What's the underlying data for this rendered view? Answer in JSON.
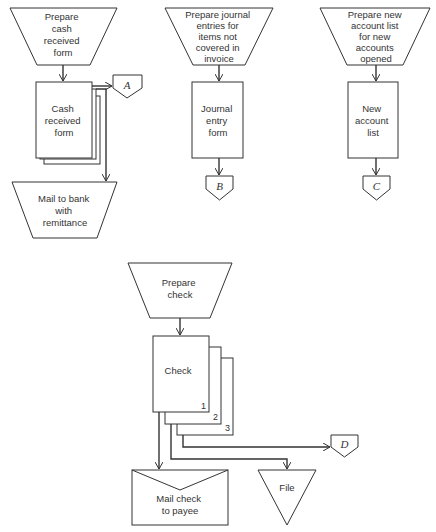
{
  "diagram": {
    "type": "flowchart",
    "flows": [
      {
        "id": "cash-received",
        "process": {
          "lines": [
            "Prepare",
            "cash",
            "received",
            "form"
          ]
        },
        "document": {
          "lines": [
            "Cash",
            "received",
            "form"
          ],
          "copies": 3
        },
        "connector": "A",
        "output": {
          "lines": [
            "Mail to bank",
            "with",
            "remittance"
          ]
        }
      },
      {
        "id": "journal-entry",
        "process": {
          "lines": [
            "Prepare journal",
            "entries for",
            "items not",
            "covered in",
            "invoice"
          ]
        },
        "document": {
          "lines": [
            "Journal",
            "entry",
            "form"
          ],
          "copies": 1
        },
        "connector": "B"
      },
      {
        "id": "new-account",
        "process": {
          "lines": [
            "Prepare new",
            "account list",
            "for new",
            "accounts",
            "opened"
          ]
        },
        "document": {
          "lines": [
            "New",
            "account",
            "list"
          ],
          "copies": 1
        },
        "connector": "C"
      },
      {
        "id": "check",
        "process": {
          "lines": [
            "Prepare",
            "check"
          ]
        },
        "document": {
          "lines": [
            "Check"
          ],
          "copies": 3,
          "copy_numbers": [
            "1",
            "2",
            "3"
          ]
        },
        "connector": "D",
        "outputs": [
          {
            "shape": "envelope",
            "lines": [
              "Mail check",
              "to payee"
            ]
          },
          {
            "shape": "file-triangle",
            "lines": [
              "File"
            ]
          }
        ]
      }
    ]
  },
  "colors": {
    "stroke": "#333333",
    "background": "#ffffff"
  }
}
